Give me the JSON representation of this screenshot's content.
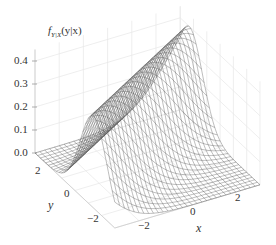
{
  "chart_data": {
    "type": "surface3d",
    "title": "",
    "function": "conditional normal density f_{Y|X}(y|x) = N(y; mu(x), 1), ridge following mu(x)",
    "zlabel_main": "f",
    "zlabel_sub": "Y|X",
    "zlabel_args": "(y|x)",
    "xlabel": "x",
    "ylabel": "y",
    "x_range": [
      -3,
      3
    ],
    "y_range": [
      -3,
      3
    ],
    "z_range": [
      0.0,
      0.45
    ],
    "x_ticks": [
      -2,
      0,
      2
    ],
    "x_tick_labels": [
      "−2",
      "0",
      "2"
    ],
    "y_ticks": [
      2,
      0,
      -2
    ],
    "y_tick_labels": [
      "2",
      "0",
      "−2"
    ],
    "z_ticks": [
      0.0,
      0.1,
      0.2,
      0.3,
      0.4
    ],
    "z_tick_labels": [
      "0.0",
      "0.1",
      "0.2",
      "0.3",
      "0.4"
    ],
    "ridge": {
      "mu_slope": 0.62,
      "mu_intercept": 0.45,
      "sigma": 1.0,
      "peak_density": 0.399
    },
    "grid_n": 31,
    "mesh_color": "#555555",
    "pane_grid_color": "#e6e6e6",
    "pane_color": "#ffffff",
    "grid": true,
    "legend": "none"
  },
  "labels": {
    "z_title_f": "f",
    "z_title_sub": "Y|X",
    "z_title_args": "(y|x)",
    "x_title": "x",
    "y_title": "y",
    "z_ticks": [
      "0.0",
      "0.1",
      "0.2",
      "0.3",
      "0.4"
    ],
    "y_ticks": [
      "2",
      "0",
      "−2"
    ],
    "x_ticks": [
      "−2",
      "0",
      "2"
    ]
  }
}
